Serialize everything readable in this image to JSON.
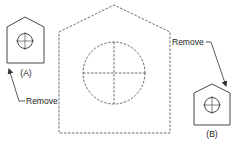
{
  "diagram": {
    "colors": {
      "stroke": "#333333",
      "text": "#222222",
      "background": "#ffffff"
    },
    "main_shape": {
      "type": "pentagon-outline-dashed",
      "label": ""
    },
    "part_a": {
      "label": "(A)",
      "callout": "Remove"
    },
    "part_b": {
      "label": "(B)",
      "callout": "Remove"
    }
  }
}
